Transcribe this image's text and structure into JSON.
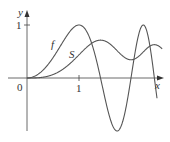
{
  "chart_data": {
    "type": "line",
    "title": "",
    "xlabel": "x",
    "ylabel": "y",
    "origin_label": "0",
    "x_ticks": [
      {
        "value": 1,
        "label": "1"
      }
    ],
    "y_ticks": [
      {
        "value": 1,
        "label": "1"
      }
    ],
    "xlim": [
      0,
      2.6
    ],
    "ylim": [
      -1,
      1.25
    ],
    "grid": false,
    "legend": "inline labels",
    "series": [
      {
        "name": "f",
        "label": "f",
        "formula": "sin(pi*x^2/2)",
        "x_range": [
          0,
          2.5
        ]
      },
      {
        "name": "S",
        "label": "S",
        "formula": "integral_0^x sin(pi*t^2/2) dt",
        "x_range": [
          0,
          2.6
        ]
      }
    ]
  },
  "labels": {
    "y_axis": "y",
    "x_axis": "x",
    "origin": "0",
    "x_tick_1": "1",
    "y_tick_1": "1",
    "f_label": "f",
    "S_label": "S"
  },
  "colors": {
    "axis": "#444444",
    "curve": "#555555"
  }
}
